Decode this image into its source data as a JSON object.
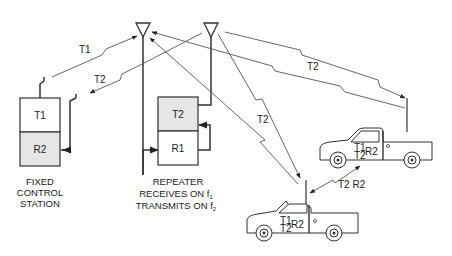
{
  "diagram": {
    "type": "repeater radio system",
    "colors": {
      "shaded_box": "#e6e6e6",
      "line": "#333333",
      "background": "#ffffff"
    },
    "fixed_station": {
      "top_box": "T1",
      "bottom_box": "R2",
      "caption": [
        "FIXED",
        "CONTROL",
        "STATION"
      ]
    },
    "repeater": {
      "top_box": "T2",
      "bottom_box": "R1",
      "caption_line1": "REPEATER",
      "caption_line2": "RECEIVES ON f",
      "caption_line2_sub": "1",
      "caption_line3": "TRANSMITS ON f",
      "caption_line3_sub": "2"
    },
    "links": {
      "fixed_to_repeater": "T1",
      "repeater_to_fixed": "T2",
      "repeater_to_truck1_t2": "T2",
      "truck1_to_repeater_t1": "T1",
      "repeater_to_truck2_t2": "T2",
      "truck2_to_repeater_t1": "T1",
      "truck_to_truck": "T2 R2"
    },
    "truck_upper": {
      "label_t1": "T1",
      "label_t2": "T2",
      "label_r2": "R2"
    },
    "truck_lower": {
      "label_t1": "T1",
      "label_t2": "T2",
      "label_r2": "R2"
    }
  }
}
